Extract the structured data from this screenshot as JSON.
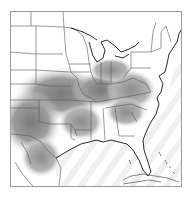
{
  "map": {
    "region": "Eastern United States",
    "style": "grayscale shaded field with state boundaries and coastlines",
    "colors": {
      "frame": "#9a9a9a",
      "background": "#ffffff",
      "boundary": "#555555",
      "coast": "#111111",
      "shade_dark": "#7a7a7a",
      "shade_mid": "#a8a8a8",
      "shade_light": "#d4d4d4",
      "ocean_stripe": "#ededed"
    },
    "legend": null,
    "labels": []
  }
}
